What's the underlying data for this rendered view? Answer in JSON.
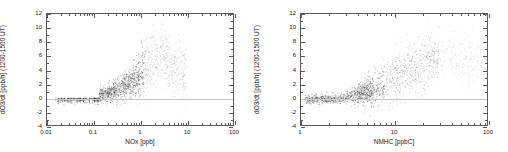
{
  "figure": {
    "background_color": "#ffffff",
    "axis_color": "#5a5a5a",
    "point_color": "#303030",
    "zero_line_color": "#c9c9c9"
  },
  "chart_data": [
    {
      "type": "scatter",
      "panel": "left",
      "title": "",
      "xlabel": "NOx [ppb]",
      "ylabel": "dO3/dt [ppb/h] (1200-1500 UT)",
      "xscale": "log",
      "yscale": "linear",
      "xlim": [
        0.01,
        100
      ],
      "ylim": [
        -4,
        12
      ],
      "xticks": [
        0.01,
        0.1,
        1,
        10,
        100
      ],
      "xtick_labels": [
        "0.01",
        "0.1",
        "1",
        "10",
        "100"
      ],
      "yticks": [
        -4,
        -2,
        0,
        2,
        4,
        6,
        8,
        10,
        12
      ],
      "ytick_labels": [
        "-4",
        "-2",
        "0",
        "2",
        "4",
        "6",
        "8",
        "10",
        "12"
      ],
      "grid": false,
      "legend": "none",
      "reference_lines": [
        {
          "axis": "y",
          "value": 0
        }
      ],
      "description": "Ozone production rate versus NOx on log axis: near-zero slightly negative values below 0.1 ppb forming vertical striations, rising tight curve through 0.1-1 ppb, broad plume peaking near 8-9 ppb/h around 1-3 ppb NOx, then declining and scattering out to 10 ppb NOx.",
      "point_count": 2100,
      "points_summary": [
        {
          "x": 0.02,
          "y": -0.45
        },
        {
          "x": 0.025,
          "y": -0.4
        },
        {
          "x": 0.03,
          "y": -0.4
        },
        {
          "x": 0.04,
          "y": -0.35
        },
        {
          "x": 0.05,
          "y": -0.3
        },
        {
          "x": 0.06,
          "y": -0.3
        },
        {
          "x": 0.07,
          "y": -0.25
        },
        {
          "x": 0.08,
          "y": -0.2
        },
        {
          "x": 0.09,
          "y": -0.15
        },
        {
          "x": 0.1,
          "y": 0.05
        },
        {
          "x": 0.12,
          "y": 0.2
        },
        {
          "x": 0.15,
          "y": 0.35
        },
        {
          "x": 0.2,
          "y": 0.6
        },
        {
          "x": 0.25,
          "y": 0.85
        },
        {
          "x": 0.3,
          "y": 1.1
        },
        {
          "x": 0.4,
          "y": 1.5
        },
        {
          "x": 0.5,
          "y": 1.8
        },
        {
          "x": 0.7,
          "y": 2.3
        },
        {
          "x": 1.0,
          "y": 3.2
        },
        {
          "x": 1.5,
          "y": 4.6
        },
        {
          "x": 2.0,
          "y": 5.6
        },
        {
          "x": 2.5,
          "y": 6.2
        },
        {
          "x": 3.0,
          "y": 5.8
        },
        {
          "x": 4.0,
          "y": 5.0
        },
        {
          "x": 5.0,
          "y": 4.4
        },
        {
          "x": 7.0,
          "y": 3.6
        },
        {
          "x": 9.0,
          "y": 3.0
        }
      ]
    },
    {
      "type": "scatter",
      "panel": "right",
      "title": "",
      "xlabel": "NMHC [ppbC]",
      "ylabel": "dO3/dt [ppb/h] (1200-1500 UT)",
      "xscale": "log",
      "yscale": "linear",
      "xlim": [
        1,
        100
      ],
      "ylim": [
        -4,
        12
      ],
      "xticks": [
        1,
        10,
        100
      ],
      "xtick_labels": [
        "1",
        "10",
        "100"
      ],
      "yticks": [
        -4,
        -2,
        0,
        2,
        4,
        6,
        8,
        10,
        12
      ],
      "ytick_labels": [
        "-4",
        "-2",
        "0",
        "2",
        "4",
        "6",
        "8",
        "10",
        "12"
      ],
      "grid": false,
      "legend": "none",
      "reference_lines": [
        {
          "axis": "y",
          "value": 0
        }
      ],
      "description": "Ozone production rate versus NMHC on log axis: dense band just below zero from 1 to 6 ppbC, fanning upward from about 3 ppbC into a broad wedge reaching 8-10 ppb/h near 20-40 ppbC, with sparse light points extending to 100 ppbC.",
      "point_count": 2100,
      "points_summary": [
        {
          "x": 1.2,
          "y": -0.3
        },
        {
          "x": 1.5,
          "y": -0.3
        },
        {
          "x": 2.0,
          "y": -0.25
        },
        {
          "x": 2.5,
          "y": -0.2
        },
        {
          "x": 3.0,
          "y": -0.1
        },
        {
          "x": 3.5,
          "y": 0.2
        },
        {
          "x": 4.0,
          "y": 0.4
        },
        {
          "x": 5.0,
          "y": 0.8
        },
        {
          "x": 6.0,
          "y": 1.2
        },
        {
          "x": 7.0,
          "y": 1.6
        },
        {
          "x": 8.0,
          "y": 2.0
        },
        {
          "x": 10.0,
          "y": 2.6
        },
        {
          "x": 12.0,
          "y": 3.2
        },
        {
          "x": 15.0,
          "y": 3.8
        },
        {
          "x": 20.0,
          "y": 4.6
        },
        {
          "x": 25.0,
          "y": 5.2
        },
        {
          "x": 30.0,
          "y": 5.6
        },
        {
          "x": 40.0,
          "y": 5.8
        },
        {
          "x": 50.0,
          "y": 5.6
        },
        {
          "x": 70.0,
          "y": 5.0
        },
        {
          "x": 90.0,
          "y": 4.6
        }
      ]
    }
  ]
}
